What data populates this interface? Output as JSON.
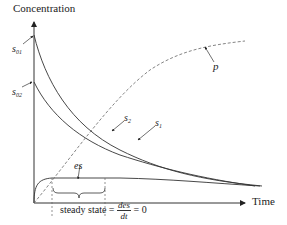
{
  "diagram": {
    "y_axis_label": "Concentration",
    "x_axis_label": "Time",
    "labels": {
      "s01": {
        "base": "s",
        "sub": "01"
      },
      "s02": {
        "base": "s",
        "sub": "02"
      },
      "s1": {
        "base": "s",
        "sub": "1"
      },
      "s2": {
        "base": "s",
        "sub": "2"
      },
      "es": "es",
      "p": "p"
    },
    "steady_state": {
      "prefix": "steady state =",
      "numerator": "des",
      "denominator": "dt",
      "suffix": "= 0"
    },
    "colors": {
      "line": "#333333",
      "dashed": "#666666"
    }
  }
}
